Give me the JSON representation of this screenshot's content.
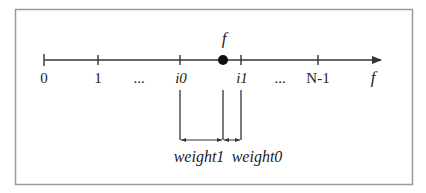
{
  "diagram": {
    "frame": {
      "x": 15,
      "y": 9,
      "width": 397,
      "height": 175,
      "stroke": "#9a9a9a"
    },
    "axis": {
      "y": 60,
      "x_start": 44,
      "x_end": 382,
      "color": "#333333",
      "arrow_label": "f"
    },
    "ticks": [
      {
        "x": 44,
        "label": "0",
        "italic": false
      },
      {
        "x": 98,
        "label": "1",
        "italic": false
      },
      {
        "x": 180,
        "label": "i0",
        "italic": true
      },
      {
        "x": 241,
        "label": "i1",
        "italic": true
      },
      {
        "x": 318,
        "label": "N-1",
        "italic": false
      }
    ],
    "ellipses": [
      {
        "x": 139,
        "label": "..."
      },
      {
        "x": 280,
        "label": "..."
      }
    ],
    "point": {
      "x": 223,
      "label": "f",
      "color": "#111111"
    },
    "brackets": {
      "y_top": 90,
      "y_bottom": 140,
      "lines_x": [
        180,
        223,
        241
      ]
    },
    "weights": [
      {
        "label": "weight1",
        "x": 197,
        "from_x": 180,
        "to_x": 223
      },
      {
        "label": "weight0",
        "x": 256,
        "from_x": 223,
        "to_x": 241
      }
    ]
  }
}
